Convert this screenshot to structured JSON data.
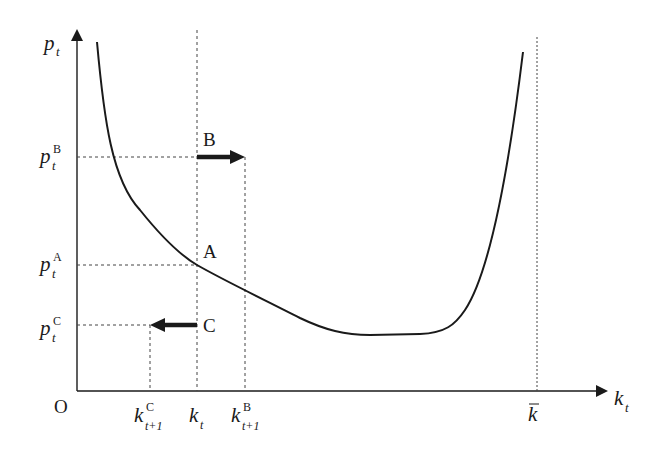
{
  "diagram": {
    "axes": {
      "y_label": {
        "main": "p",
        "sub": "t"
      },
      "x_label": {
        "main": "k",
        "sub": "t"
      },
      "origin": "O"
    },
    "y_ticks": [
      {
        "main": "p",
        "sub": "t",
        "sup": "B"
      },
      {
        "main": "p",
        "sub": "t",
        "sup": "A"
      },
      {
        "main": "p",
        "sub": "t",
        "sup": "C"
      }
    ],
    "x_ticks": [
      {
        "main": "k",
        "sub": "t+1",
        "sup": "C"
      },
      {
        "main": "k",
        "sub": "t",
        "sup": ""
      },
      {
        "main": "k",
        "sub": "t+1",
        "sup": "B"
      },
      {
        "main": "k",
        "bar": true
      }
    ],
    "points": {
      "A": "A",
      "B": "B",
      "C": "C"
    },
    "arrows": [
      {
        "label": "B",
        "direction": "right",
        "from": "k_t",
        "to": "k^B_{t+1}"
      },
      {
        "label": "C",
        "direction": "left",
        "from": "k_t",
        "to": "k^C_{t+1}"
      }
    ],
    "curve": "U-shaped curve p_t as function of k_t, diverging near k-bar",
    "colors": {
      "ink": "#1a1a1a",
      "background": "#ffffff"
    }
  }
}
